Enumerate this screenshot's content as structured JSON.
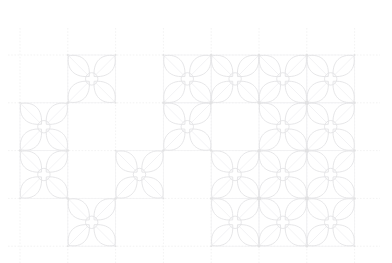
{
  "canvas": {
    "width": 392,
    "height": 263,
    "background_color": "#ffffff",
    "title": "sashiko-style four-petal flower lattice pattern"
  },
  "style": {
    "grid_line_color": "#eeeeee",
    "grid_line_width": 0.7,
    "grid_dash": "1.6 1.6",
    "motif_stroke_color": "#e3e3e5",
    "motif_stroke_width": 0.85,
    "motif_inner_stroke_color": "#ebebed",
    "motif_inner_stroke_width": 0.6,
    "cell_outline_color": "#f1f1f3",
    "node_dot_color": "#dcdcde"
  },
  "grid": {
    "origin_x": 20,
    "origin_y": 55,
    "cell_size": 47.8,
    "columns": 7,
    "rows": 4,
    "x_lines": [
      20,
      67.8,
      115.6,
      163.4,
      211.2,
      259.0,
      306.8,
      354.6
    ],
    "y_lines": [
      55,
      102.8,
      150.6,
      198.4,
      246.2
    ],
    "h_line_extent": [
      8,
      380
    ],
    "v_line_extent": [
      28,
      263
    ],
    "h_line_labels": [
      "guide-row-0",
      "guide-row-1",
      "guide-row-2",
      "guide-row-3",
      "guide-row-4"
    ],
    "v_line_labels": [
      "guide-col-0",
      "guide-col-1",
      "guide-col-2",
      "guide-col-3",
      "guide-col-4",
      "guide-col-5",
      "guide-col-6",
      "guide-col-7"
    ]
  },
  "motif": {
    "name": "four-petal-flower",
    "petal_count": 4,
    "petal_orientation_degrees": [
      45,
      135,
      225,
      315
    ],
    "center_circle_radius": 6.2,
    "petal_length_ratio": 0.68,
    "petal_width_ratio": 0.3,
    "has_cell_square_outline": true,
    "has_inner_petal_vein": true
  },
  "chart_data": {
    "type": "heatmap",
    "xlabel": "column",
    "ylabel": "row",
    "categories_x": [
      "c0",
      "c1",
      "c2",
      "c3",
      "c4",
      "c5",
      "c6"
    ],
    "categories_y": [
      "r0",
      "r1",
      "r2",
      "r3"
    ],
    "grid": "on",
    "legend": "none",
    "values": [
      [
        0,
        1,
        0,
        1,
        1,
        1,
        1
      ],
      [
        1,
        0,
        0,
        1,
        0,
        1,
        1
      ],
      [
        1,
        0,
        1,
        0,
        1,
        1,
        1
      ],
      [
        0,
        1,
        0,
        0,
        1,
        1,
        1
      ]
    ],
    "filled_cells": [
      {
        "row": 0,
        "col": 1
      },
      {
        "row": 0,
        "col": 3
      },
      {
        "row": 0,
        "col": 4
      },
      {
        "row": 0,
        "col": 5
      },
      {
        "row": 0,
        "col": 6
      },
      {
        "row": 1,
        "col": 0
      },
      {
        "row": 1,
        "col": 3
      },
      {
        "row": 1,
        "col": 5
      },
      {
        "row": 1,
        "col": 6
      },
      {
        "row": 2,
        "col": 0
      },
      {
        "row": 2,
        "col": 2
      },
      {
        "row": 2,
        "col": 4
      },
      {
        "row": 2,
        "col": 5
      },
      {
        "row": 2,
        "col": 6
      },
      {
        "row": 3,
        "col": 1
      },
      {
        "row": 3,
        "col": 4
      },
      {
        "row": 3,
        "col": 5
      },
      {
        "row": 3,
        "col": 6
      }
    ],
    "filled_count": 18,
    "total_cells": 28
  }
}
